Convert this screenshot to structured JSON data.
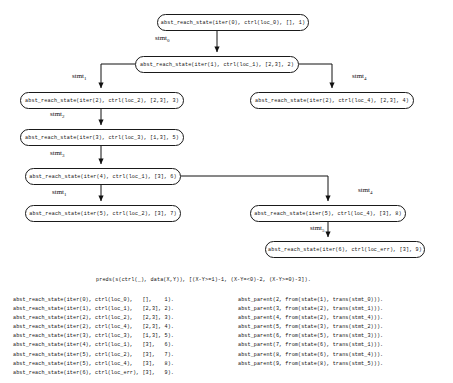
{
  "diagram": {
    "nodes": [
      {
        "id": "n1",
        "label": "abst_reach_state(iter(0), ctrl(loc_0), [], 1)",
        "x": 157,
        "y": 14,
        "w": 152
      },
      {
        "id": "n2",
        "label": "abst_reach_state(iter(1), ctrl(loc_1), [2,3], 2)",
        "x": 135,
        "y": 56,
        "w": 164
      },
      {
        "id": "n3",
        "label": "abst_reach_state(iter(2), ctrl(loc_2), [2,3], 3)",
        "x": 20,
        "y": 92,
        "w": 164
      },
      {
        "id": "n4",
        "label": "abst_reach_state(iter(2), ctrl(loc_4), [2,3], 4)",
        "x": 250,
        "y": 92,
        "w": 164
      },
      {
        "id": "n5",
        "label": "abst_reach_state(iter(3), ctrl(loc_3), [1,3], 5)",
        "x": 20,
        "y": 129,
        "w": 164
      },
      {
        "id": "n6",
        "label": "abst_reach_state(iter(4), ctrl(loc_1), [3], 6)",
        "x": 25,
        "y": 168,
        "w": 156
      },
      {
        "id": "n7",
        "label": "abst_reach_state(iter(5), ctrl(loc_2), [3], 7)",
        "x": 25,
        "y": 205,
        "w": 156
      },
      {
        "id": "n8",
        "label": "abst_reach_state(iter(5), ctrl(loc_4), [3], 8)",
        "x": 250,
        "y": 205,
        "w": 156
      },
      {
        "id": "n9",
        "label": "abst_reach_state(iter(6), ctrl(loc_err), [3], 9)",
        "x": 265,
        "y": 241,
        "w": 160
      }
    ],
    "edge_labels": [
      {
        "id": "e0",
        "base": "stmt",
        "sub": "0",
        "x": 155,
        "y": 34
      },
      {
        "id": "e1",
        "base": "stmt",
        "sub": "1",
        "x": 72,
        "y": 72
      },
      {
        "id": "e4a",
        "base": "stmt",
        "sub": "4",
        "x": 352,
        "y": 72
      },
      {
        "id": "e2",
        "base": "stmt",
        "sub": "2",
        "x": 50,
        "y": 110
      },
      {
        "id": "e3",
        "base": "stmt",
        "sub": "3",
        "x": 50,
        "y": 149
      },
      {
        "id": "e1b",
        "base": "stmt",
        "sub": "1",
        "x": 52,
        "y": 188
      },
      {
        "id": "e4b",
        "base": "stmt",
        "sub": "4",
        "x": 358,
        "y": 186
      },
      {
        "id": "e5",
        "base": "stmt",
        "sub": "5",
        "x": 310,
        "y": 224
      }
    ]
  },
  "listing": {
    "preds": "preds(s(ctrl(_), data(X,Y)), [(X-Y>=1)-1, (X-Y=<0)-2, (X-Y>=0)-3]).",
    "left_facts": [
      "abst_reach_state(iter(0), ctrl(loc_0),   [],    1).",
      "abst_reach_state(iter(1), ctrl(loc_1),   [2,3], 2).",
      "abst_reach_state(iter(2), ctrl(loc_2),   [2,3], 3).",
      "abst_reach_state(iter(2), ctrl(loc_4),   [2,3], 4).",
      "abst_reach_state(iter(3), ctrl(loc_3),   [1,3], 5).",
      "abst_reach_state(iter(4), ctrl(loc_1),   [3],   6).",
      "abst_reach_state(iter(5), ctrl(loc_2),   [3],   7).",
      "abst_reach_state(iter(5), ctrl(loc_4),   [3],   8).",
      "abst_reach_state(iter(6), ctrl(loc_err), [3],   9)."
    ],
    "right_facts": [
      "abst_parent(2, from(state(1), trans(stmt_0))).",
      "abst_parent(3, from(state(2), trans(stmt_1))).",
      "abst_parent(4, from(state(2), trans(stmt_4))).",
      "abst_parent(5, from(state(3), trans(stmt_2))).",
      "abst_parent(6, from(state(5), trans(stmt_3))).",
      "abst_parent(7, from(state(6), trans(stmt_1))).",
      "abst_parent(8, from(state(6), trans(stmt_4))).",
      "abst_parent(9, from(state(8), trans(stmt_5)))."
    ]
  }
}
